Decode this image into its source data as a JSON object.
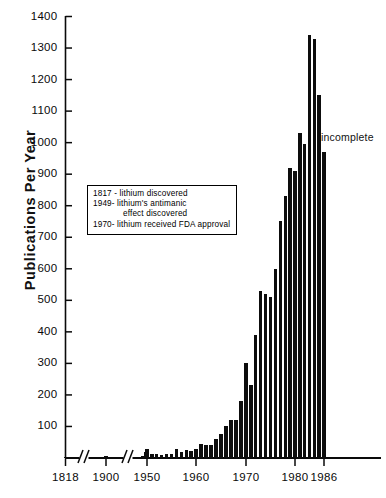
{
  "chart": {
    "type": "bar",
    "title": "",
    "ylabel": "Publications  Per  Year",
    "xlabel": "",
    "incomplete_note": "incomplete",
    "y_ticks": [
      100,
      200,
      300,
      400,
      500,
      600,
      700,
      800,
      900,
      1000,
      1100,
      1200,
      1300,
      1400
    ],
    "y_tick_labels": [
      "100",
      "200",
      "300",
      "400",
      "500",
      "600",
      "700",
      "800",
      "900",
      "1000",
      "1100",
      "1200",
      "1300",
      "1400"
    ],
    "ylim": [
      0,
      1400
    ],
    "x_ticks": [
      "1818",
      "1900",
      "1950",
      "1960",
      "1970",
      "1980",
      "1986"
    ],
    "axis_breaks": 2,
    "grid": false,
    "legend": null,
    "bar_color": "#0d0d0d"
  },
  "annotations": {
    "box_lines": [
      {
        "text": "1817 - lithium discovered",
        "indent": false
      },
      {
        "text": "1949- lithium's antimanic",
        "indent": false
      },
      {
        "text": "effect  discovered",
        "indent": true
      },
      {
        "text": "1970- lithium received FDA approval",
        "indent": false
      }
    ]
  },
  "chart_data": {
    "type": "bar",
    "title": "",
    "xlabel": "",
    "ylabel": "Publications Per Year",
    "ylim": [
      0,
      1400
    ],
    "grid": false,
    "legend_position": "none",
    "axis_note": "x axis has two break marks: between 1818 and 1900, and between 1900 and 1945",
    "annotations": [
      {
        "text": "incomplete",
        "x": 1986,
        "y": 1010
      },
      {
        "text": "1817 - lithium discovered"
      },
      {
        "text": "1949- lithium's antimanic effect discovered"
      },
      {
        "text": "1970- lithium received FDA approval"
      }
    ],
    "categories": [
      1818,
      1900,
      1945,
      1946,
      1947,
      1948,
      1949,
      1950,
      1951,
      1952,
      1953,
      1954,
      1955,
      1956,
      1957,
      1958,
      1959,
      1960,
      1961,
      1962,
      1963,
      1964,
      1965,
      1966,
      1967,
      1968,
      1969,
      1970,
      1971,
      1972,
      1973,
      1974,
      1975,
      1976,
      1977,
      1978,
      1979,
      1980,
      1981,
      1982,
      1983,
      1984,
      1985,
      1986
    ],
    "values": [
      4,
      6,
      6,
      7,
      5,
      6,
      20,
      28,
      14,
      12,
      10,
      12,
      12,
      28,
      18,
      25,
      22,
      30,
      45,
      42,
      40,
      60,
      75,
      100,
      120,
      120,
      180,
      300,
      230,
      390,
      530,
      520,
      510,
      600,
      750,
      830,
      920,
      910,
      1030,
      995,
      1340,
      1330,
      1150,
      970
    ]
  }
}
